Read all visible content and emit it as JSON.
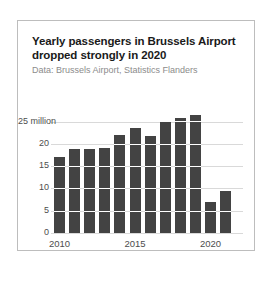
{
  "card": {
    "title": "Yearly passengers in Brussels Airport dropped strongly in 2020",
    "subtitle": "Data: Brussels Airport, Statistics Flanders"
  },
  "chart_data": {
    "type": "bar",
    "title": "Yearly passengers in Brussels Airport dropped strongly in 2020",
    "subtitle": "Data: Brussels Airport, Statistics Flanders",
    "xlabel": "",
    "ylabel": "",
    "categories": [
      "2010",
      "2011",
      "2012",
      "2013",
      "2014",
      "2015",
      "2016",
      "2017",
      "2018",
      "2019",
      "2020",
      "2021"
    ],
    "values": [
      17.0,
      18.8,
      18.9,
      19.1,
      21.9,
      23.5,
      21.8,
      24.8,
      25.7,
      26.4,
      6.9,
      9.4
    ],
    "ylim": [
      0,
      27.5
    ],
    "yticks": [
      0,
      5,
      10,
      15,
      20,
      25
    ],
    "ytick_labels": [
      "0",
      "5",
      "10",
      "15",
      "20",
      "25 million"
    ],
    "xticks": [
      "2010",
      "2015",
      "2020"
    ],
    "grid": true,
    "legend": false,
    "bar_color": "#434343",
    "grid_color": "#d9d9d9"
  }
}
